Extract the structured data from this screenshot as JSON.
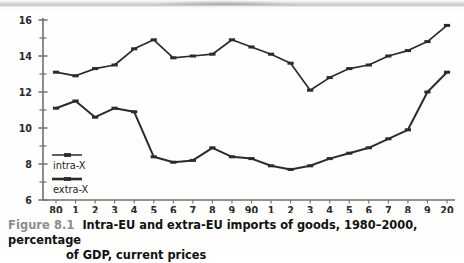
{
  "figure": {
    "label": "Figure 8.1",
    "caption_line1": "Intra-EU and extra-EU imports of goods, 1980–2000, percentage",
    "caption_line2": "of GDP, current prices"
  },
  "chart_data": {
    "type": "line",
    "title": "Intra-EU and extra-EU imports of goods, 1980–2000, percentage of GDP, current prices",
    "xlabel": "",
    "ylabel": "",
    "ylim": [
      6,
      16
    ],
    "ytick_labels": [
      "16",
      "14",
      "12",
      "10",
      "8",
      "6"
    ],
    "ytick_values": [
      16,
      14,
      12,
      10,
      8,
      6
    ],
    "yminor_values": [
      15,
      13,
      11,
      9,
      7
    ],
    "grid": false,
    "legend_position": "inside lower-left",
    "x": [
      1980,
      1981,
      1982,
      1983,
      1984,
      1985,
      1986,
      1987,
      1988,
      1989,
      1990,
      1991,
      1992,
      1993,
      1994,
      1995,
      1996,
      1997,
      1998,
      1999,
      2000
    ],
    "xtick_labels": [
      "80",
      "1",
      "2",
      "3",
      "4",
      "5",
      "6",
      "7",
      "8",
      "9",
      "90",
      "1",
      "2",
      "3",
      "4",
      "5",
      "6",
      "7",
      "8",
      "9",
      "20"
    ],
    "series": [
      {
        "name": "intra-X",
        "values": [
          13.1,
          12.9,
          13.3,
          13.5,
          14.4,
          14.9,
          13.9,
          14.0,
          14.1,
          14.9,
          14.5,
          14.1,
          13.6,
          12.1,
          12.8,
          13.3,
          13.5,
          14.0,
          14.3,
          14.8,
          15.7
        ]
      },
      {
        "name": "extra-X",
        "values": [
          11.1,
          11.5,
          10.6,
          11.1,
          10.9,
          8.4,
          8.1,
          8.2,
          8.9,
          8.4,
          8.3,
          7.9,
          7.7,
          7.9,
          8.3,
          8.6,
          8.9,
          9.4,
          9.9,
          12.0,
          13.1
        ]
      }
    ]
  },
  "colors": {
    "line": "#2b2b2b",
    "axis": "#6f6f6f",
    "text": "#111111",
    "caption_label": "#8d8d8d",
    "page": "#fdfdfc"
  }
}
